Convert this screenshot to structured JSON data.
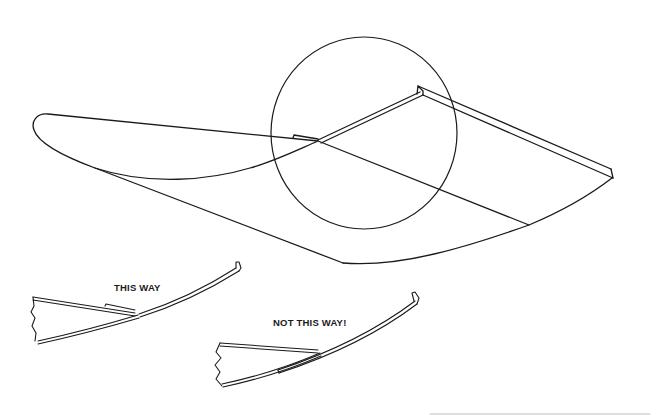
{
  "figure": {
    "type": "technical-illustration",
    "colors": {
      "ink": "#1a1a1a",
      "background": "#ffffff"
    }
  },
  "details": {
    "correct": {
      "label": "THIS WAY"
    },
    "incorrect": {
      "label": "NOT THIS WAY!"
    }
  }
}
